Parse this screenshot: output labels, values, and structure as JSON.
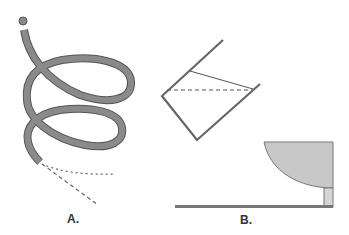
{
  "figure": {
    "panels": [
      {
        "id": "A",
        "label": "A.",
        "description": "coiled tube with end ball and dashed trajectory lines"
      },
      {
        "id": "B",
        "label": "B.",
        "description": "tilted beaker with liquid lines above a bowl on a base"
      }
    ],
    "colors": {
      "tube_fill": "#8a8a8a",
      "tube_outline": "#555555",
      "line": "#666666",
      "bowl_fill": "#c8c8c8",
      "base": "#777777"
    }
  }
}
